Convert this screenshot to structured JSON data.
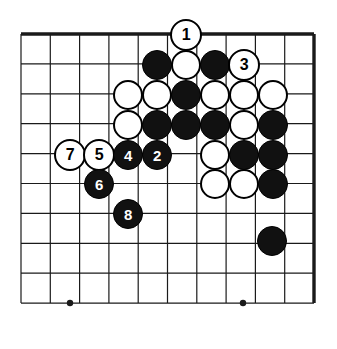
{
  "figure": {
    "type": "go-board-diagram",
    "caption": "",
    "width": 337,
    "height": 349,
    "background_color": "#ffffff"
  },
  "board": {
    "label": "Go board grid",
    "columns": 11,
    "rows": 10,
    "origin_x": 21,
    "origin_y": 34,
    "col_spacing": 29.3,
    "row_spacing": 29.9,
    "line_color": "#1a1a1a",
    "line_width": 1.2,
    "edge_line_width": 3.4,
    "edges": {
      "top": true,
      "right": true,
      "left": false,
      "bottom": false
    },
    "star_points": [
      {
        "col": 0,
        "row": 9,
        "x": 70,
        "y": 303
      },
      {
        "col": 0,
        "row": 4,
        "x": 70,
        "y": 155
      },
      {
        "col": 0,
        "row": 9,
        "x": 243,
        "y": 303
      }
    ],
    "star_point_radius": 3.2
  },
  "stones": [
    {
      "name": "white-stone-move-1",
      "color": "white",
      "label": "1",
      "x": 186,
      "y": 35,
      "r": 16
    },
    {
      "name": "black-stone",
      "color": "black",
      "label": "",
      "x": 157,
      "y": 65,
      "r": 15
    },
    {
      "name": "white-stone",
      "color": "white",
      "label": "",
      "x": 186,
      "y": 65,
      "r": 15
    },
    {
      "name": "black-stone",
      "color": "black",
      "label": "",
      "x": 215,
      "y": 65,
      "r": 15
    },
    {
      "name": "white-stone-move-3",
      "color": "white",
      "label": "3",
      "x": 244,
      "y": 65,
      "r": 16
    },
    {
      "name": "white-stone",
      "color": "white",
      "label": "",
      "x": 128,
      "y": 95,
      "r": 15
    },
    {
      "name": "white-stone",
      "color": "white",
      "label": "",
      "x": 157,
      "y": 95,
      "r": 15
    },
    {
      "name": "black-stone",
      "color": "black",
      "label": "",
      "x": 186,
      "y": 95,
      "r": 15
    },
    {
      "name": "white-stone",
      "color": "white",
      "label": "",
      "x": 215,
      "y": 95,
      "r": 15
    },
    {
      "name": "white-stone",
      "color": "white",
      "label": "",
      "x": 244,
      "y": 95,
      "r": 15
    },
    {
      "name": "white-stone",
      "color": "white",
      "label": "",
      "x": 273,
      "y": 95,
      "r": 15
    },
    {
      "name": "white-stone",
      "color": "white",
      "label": "",
      "x": 128,
      "y": 125,
      "r": 15
    },
    {
      "name": "black-stone",
      "color": "black",
      "label": "",
      "x": 157,
      "y": 125,
      "r": 15
    },
    {
      "name": "black-stone",
      "color": "black",
      "label": "",
      "x": 186,
      "y": 125,
      "r": 15
    },
    {
      "name": "black-stone",
      "color": "black",
      "label": "",
      "x": 215,
      "y": 125,
      "r": 15
    },
    {
      "name": "white-stone",
      "color": "white",
      "label": "",
      "x": 244,
      "y": 125,
      "r": 15
    },
    {
      "name": "black-stone",
      "color": "black",
      "label": "",
      "x": 273,
      "y": 125,
      "r": 15
    },
    {
      "name": "white-stone-move-7",
      "color": "white",
      "label": "7",
      "x": 70,
      "y": 155,
      "r": 16
    },
    {
      "name": "white-stone-move-5",
      "color": "white",
      "label": "5",
      "x": 99,
      "y": 155,
      "r": 16
    },
    {
      "name": "black-stone-move-4",
      "color": "black",
      "label": "4",
      "x": 128,
      "y": 155,
      "r": 15
    },
    {
      "name": "black-stone-move-2",
      "color": "black",
      "label": "2",
      "x": 157,
      "y": 155,
      "r": 15
    },
    {
      "name": "white-stone",
      "color": "white",
      "label": "",
      "x": 215,
      "y": 155,
      "r": 15
    },
    {
      "name": "black-stone",
      "color": "black",
      "label": "",
      "x": 244,
      "y": 155,
      "r": 15
    },
    {
      "name": "black-stone",
      "color": "black",
      "label": "",
      "x": 273,
      "y": 155,
      "r": 15
    },
    {
      "name": "black-stone-move-6",
      "color": "black",
      "label": "6",
      "x": 99,
      "y": 184,
      "r": 15
    },
    {
      "name": "white-stone",
      "color": "white",
      "label": "",
      "x": 215,
      "y": 184,
      "r": 15
    },
    {
      "name": "white-stone",
      "color": "white",
      "label": "",
      "x": 244,
      "y": 184,
      "r": 15
    },
    {
      "name": "black-stone",
      "color": "black",
      "label": "",
      "x": 273,
      "y": 184,
      "r": 15
    },
    {
      "name": "black-stone-move-8",
      "color": "black",
      "label": "8",
      "x": 128,
      "y": 214,
      "r": 15
    },
    {
      "name": "black-stone",
      "color": "black",
      "label": "",
      "x": 272,
      "y": 241,
      "r": 15
    }
  ],
  "move_numbers": [
    "1",
    "2",
    "3",
    "4",
    "5",
    "6",
    "7",
    "8"
  ]
}
